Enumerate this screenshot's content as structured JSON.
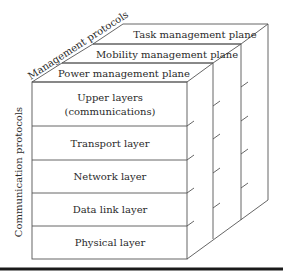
{
  "diagram": {
    "axes": {
      "management": "Management protocols",
      "communication": "Communication protocols"
    },
    "planes": [
      {
        "label": "Task management plane"
      },
      {
        "label": "Mobility management plane"
      },
      {
        "label": "Power management plane"
      }
    ],
    "layers": [
      {
        "label_line1": "Upper layers",
        "label_line2": "(communications)"
      },
      {
        "label": "Transport layer"
      },
      {
        "label": "Network layer"
      },
      {
        "label": "Data link layer"
      },
      {
        "label": "Physical layer"
      }
    ],
    "colors": {
      "line": "#555555",
      "text": "#2a2a2a",
      "rule": "#1a1a1a",
      "background": "#ffffff"
    }
  }
}
